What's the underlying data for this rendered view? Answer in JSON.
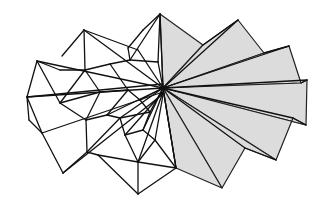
{
  "figure": {
    "description": "Line drawing of a folded polyhedral fan: wireframe triangles on the left, shaded folded panels on the right, all radiating from a central hub",
    "hub": [
      163,
      88
    ],
    "colors": {
      "background": "#ffffff",
      "line": "#111111",
      "shaded_fill": "#dcdcdc"
    },
    "shaded_panels": [
      {
        "points": "163,88 160,14 203,45"
      },
      {
        "points": "163,88 203,45 238,20 264,53"
      },
      {
        "points": "163,88 264,53 289,46 301,83"
      },
      {
        "points": "163,88 301,83 307,80 306,125"
      },
      {
        "points": "163,88 306,125 293,118 276,160"
      },
      {
        "points": "163,88 276,160 245,148 222,188"
      },
      {
        "points": "163,88 222,188 176,168"
      }
    ],
    "shaded_creases": [
      "163,88 238,20",
      "163,88 289,46",
      "163,88 307,80",
      "163,88 293,118",
      "163,88 245,148",
      "163,88 176,168",
      "203,45 238,20",
      "264,53 289,46",
      "301,83 307,80",
      "306,125 293,118",
      "276,160 245,148"
    ],
    "wire_lines": [
      "163,88 160,14",
      "160,14 143,30",
      "143,30 128,48",
      "160,14 130,60",
      "160,14 158,62",
      "84,30 163,88",
      "84,30 62,56",
      "84,30 85,70",
      "84,30 138,50",
      "138,50 163,88",
      "37,61 163,88",
      "37,61 27,97",
      "37,61 60,103",
      "37,61 60,70",
      "60,70 85,70",
      "85,70 60,103",
      "85,70 110,64",
      "110,64 130,60",
      "85,70 100,92",
      "110,64 128,90",
      "128,48 130,60",
      "130,60 158,62",
      "158,62 163,88",
      "27,97 163,88",
      "27,97 163,84",
      "27,97 42,133",
      "27,97 29,120",
      "42,133 163,92",
      "42,133 63,173",
      "29,120 42,133",
      "60,103 100,92",
      "100,92 128,90",
      "60,103 86,120",
      "86,120 100,92",
      "86,120 107,115",
      "107,115 128,90",
      "107,115 163,88",
      "86,120 87,152",
      "87,152 63,173",
      "87,152 98,155",
      "63,173 163,94",
      "98,155 138,162",
      "87,152 120,118",
      "120,118 163,88",
      "120,118 125,135",
      "125,135 163,92",
      "125,135 138,162",
      "138,162 163,92",
      "98,155 138,194",
      "138,162 138,194",
      "138,194 176,168",
      "138,162 176,168",
      "143,130 163,88",
      "143,130 125,135",
      "143,130 155,140",
      "155,140 163,95",
      "155,140 138,162",
      "155,140 176,168",
      "176,168 163,88",
      "150,112 163,88",
      "150,112 143,130",
      "150,112 120,118",
      "107,115 120,118",
      "140,100 163,88",
      "140,100 128,90",
      "140,100 150,112"
    ]
  }
}
